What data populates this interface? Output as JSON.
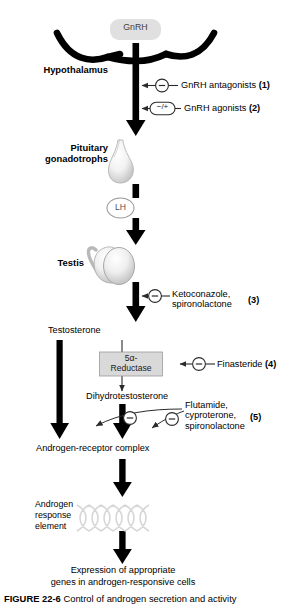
{
  "figure": {
    "caption_label": "FIGURE 22-6",
    "caption_text": "Control of androgen secretion and activity"
  },
  "nodes": {
    "gnrh": "GnRH",
    "hypothalamus": "Hypothalamus",
    "pituitary_line1": "Pituitary",
    "pituitary_line2": "gonadotrophs",
    "lh": "LH",
    "testis": "Testis",
    "testosterone": "Testosterone",
    "reductase_line1": "5α-",
    "reductase_line2": "Reductase",
    "dht": "Dihydrotestosterone",
    "androgen_receptor_complex": "Androgen-receptor complex",
    "are_line1": "Androgen",
    "are_line2": "response",
    "are_line3": "element",
    "expression_line1": "Expression of appropriate",
    "expression_line2": "genes in androgen-responsive cells"
  },
  "interventions": [
    {
      "id": "1",
      "sign": "−",
      "number": "(1)",
      "lines": [
        "GnRH antagonists"
      ],
      "shape": "circle"
    },
    {
      "id": "2",
      "sign": "−/+",
      "number": "(2)",
      "lines": [
        "GnRH agonists"
      ],
      "shape": "oval"
    },
    {
      "id": "3",
      "sign": "−",
      "number": "(3)",
      "lines": [
        "Ketoconazole,",
        "spironolactone"
      ],
      "shape": "circle"
    },
    {
      "id": "4",
      "sign": "−",
      "number": "(4)",
      "lines": [
        "Finasteride"
      ],
      "shape": "circle"
    },
    {
      "id": "5",
      "sign": "−",
      "number": "(5)",
      "lines": [
        "Flutamide,",
        "cyproterone,",
        "spironolactone"
      ],
      "shape": "circle"
    }
  ],
  "colors": {
    "arrow_black": "#000000",
    "gnrh_box_fill": "#e0e0e0",
    "reductase_box_fill": "#d9d9d9",
    "thin_line": "#3a3a3a",
    "dna_gray": "#d8d8d8",
    "organ_gray": "#c9c9c9"
  }
}
